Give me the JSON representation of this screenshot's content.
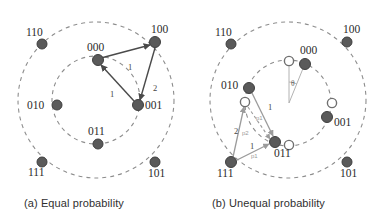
{
  "figure": {
    "width": 386,
    "height": 224,
    "background": "#ffffff",
    "type": "diagram"
  },
  "colors": {
    "node_fill": "#5a5a5a",
    "node_stroke": "#3f3f3f",
    "hollow_fill": "#ffffff",
    "hollow_stroke": "#6f6f6f",
    "circle_dash": "#8d8d8d",
    "arrow_dark": "#4a4a4a",
    "arrow_gray": "#9b9b9b",
    "text": "#2b2b2b",
    "faint_text": "#9a9a9a"
  },
  "panels": [
    {
      "id": "a",
      "caption": "(a) Equal probability",
      "center": {
        "x": 96,
        "y": 100
      },
      "outer_radius": 78,
      "inner_radius": 44,
      "nodes": [
        {
          "label": "110",
          "x": 42,
          "y": 44,
          "kind": "filled",
          "label_dx": -16,
          "label_dy": -8
        },
        {
          "label": "100",
          "x": 155,
          "y": 42,
          "kind": "filled",
          "label_dx": -4,
          "label_dy": -9
        },
        {
          "label": "010",
          "x": 57,
          "y": 105,
          "kind": "filled",
          "label_dx": -22,
          "label_dy": 4
        },
        {
          "label": "011",
          "x": 98,
          "y": 144,
          "kind": "filled",
          "label_dx": -4,
          "label_dy": -9
        },
        {
          "label": "111",
          "x": 42,
          "y": 162,
          "kind": "filled",
          "label_dx": -14,
          "label_dy": 14
        },
        {
          "label": "101",
          "x": 155,
          "y": 162,
          "kind": "filled",
          "label_dx": -4,
          "label_dy": 15
        },
        {
          "label": "000",
          "x": 98,
          "y": 60,
          "kind": "filled",
          "label_dx": -4,
          "label_dy": -9
        },
        {
          "label": "001",
          "x": 138,
          "y": 105,
          "kind": "filled",
          "label_dx": 7,
          "label_dy": 4
        }
      ],
      "edges": [
        {
          "from": "000",
          "to": "100",
          "weight": "1",
          "style": "solid-dark",
          "lx": 128,
          "ly": 70
        },
        {
          "from": "100",
          "to": "001",
          "weight": "2",
          "style": "solid-dark",
          "lx": 153,
          "ly": 91
        },
        {
          "from": "001",
          "to": "000",
          "weight": "1",
          "style": "solid-dark",
          "lx": 110,
          "ly": 97
        }
      ]
    },
    {
      "id": "b",
      "caption": "(b) Unequal probability",
      "center": {
        "x": 288,
        "y": 100
      },
      "outer_radius": 78,
      "inner_radius": 44,
      "nodes": [
        {
          "label": "110",
          "x": 231,
          "y": 44,
          "kind": "filled",
          "label_dx": -16,
          "label_dy": -8
        },
        {
          "label": "100",
          "x": 347,
          "y": 42,
          "kind": "filled",
          "label_dx": -4,
          "label_dy": -9
        },
        {
          "label": "111",
          "x": 231,
          "y": 162,
          "kind": "filled",
          "label_dx": -14,
          "label_dy": 15
        },
        {
          "label": "101",
          "x": 347,
          "y": 162,
          "kind": "filled",
          "label_dx": -4,
          "label_dy": 15
        },
        {
          "label": "000",
          "x": 305,
          "y": 64,
          "kind": "filled",
          "label_dx": -2,
          "label_dy": -10
        },
        {
          "label": "010",
          "x": 249,
          "y": 88,
          "kind": "filled",
          "label_dx": -25,
          "label_dy": 1
        },
        {
          "label": "001",
          "x": 327,
          "y": 117,
          "kind": "filled",
          "label_dx": 8,
          "label_dy": 9
        },
        {
          "label": "011",
          "x": 275,
          "y": 142,
          "kind": "filled",
          "label_dx": 1,
          "label_dy": 15
        },
        {
          "label": "",
          "x": 289,
          "y": 61,
          "kind": "hollow"
        },
        {
          "label": "",
          "x": 245,
          "y": 102,
          "kind": "hollow"
        },
        {
          "label": "",
          "x": 332,
          "y": 103,
          "kind": "hollow"
        },
        {
          "label": "",
          "x": 289,
          "y": 145,
          "kind": "hollow"
        }
      ],
      "edges": [
        {
          "from": "010",
          "to": "011",
          "weight": "1",
          "style": "solid-gray",
          "lx": 268,
          "ly": 110
        },
        {
          "from": "010h",
          "to": "011",
          "weight": "p1",
          "style": "dashed-gray",
          "lx": 256,
          "ly": 120
        },
        {
          "from": "111",
          "to": "010h",
          "weight": "2",
          "style": "solid-gray",
          "lx": 236,
          "ly": 132
        },
        {
          "from": "111",
          "to": "010h",
          "weight": "p2",
          "style": "label-only",
          "lx": 246,
          "ly": 134
        },
        {
          "from": "111",
          "to": "011",
          "weight": "1",
          "style": "solid-gray",
          "lx": 252,
          "ly": 147
        },
        {
          "from": "111",
          "to": "011",
          "weight": "p1",
          "style": "label-only",
          "lx": 253,
          "ly": 157
        }
      ],
      "angle_marker": {
        "label": "θ",
        "x": 293,
        "y": 84
      }
    }
  ]
}
